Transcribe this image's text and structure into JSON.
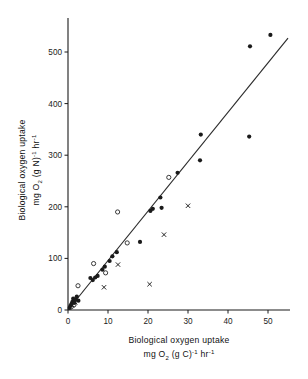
{
  "figure": {
    "background": "#ffffff",
    "ink": "#1a1a1a"
  },
  "chart_data": {
    "type": "scatter",
    "title": "",
    "xlabel": "Biological oxygen uptake mg O2 (g C)-1 hr-1",
    "ylabel": "Biological oxygen uptake mg O2 (g N)-1 hr-1",
    "xlabel_line1": "Biological  oxygen  uptake",
    "xlabel_line2_pre": "mg O",
    "xlabel_line2_sub": "2",
    "xlabel_line2_mid": "  (g C)",
    "xlabel_line2_sup1": "-1",
    "xlabel_line2_post": " hr",
    "xlabel_line2_sup2": "-1",
    "ylabel_line1": "Biological  oxygen  uptake",
    "ylabel_line2_pre": "mg O",
    "ylabel_line2_sub": "2",
    "ylabel_line2_mid": "  (g N)",
    "ylabel_line2_sup1": "-1",
    "ylabel_line2_post": " hr",
    "ylabel_line2_sup2": "-1",
    "xlim": [
      0,
      55
    ],
    "ylim": [
      0,
      545
    ],
    "xticks": [
      0,
      10,
      20,
      30,
      40,
      50
    ],
    "yticks": [
      0,
      100,
      200,
      300,
      400,
      500
    ],
    "xtick_labels": [
      "0",
      "10",
      "20",
      "30",
      "40",
      "50"
    ],
    "ytick_labels": [
      "0",
      "100",
      "200",
      "300",
      "400",
      "500"
    ],
    "grid": false,
    "legend": "none",
    "series": [
      {
        "name": "filled-circle",
        "marker": "filled-circle",
        "color": "#1a1a1a",
        "points": [
          [
            0.4,
            4
          ],
          [
            0.6,
            8
          ],
          [
            0.9,
            12
          ],
          [
            1.1,
            16
          ],
          [
            1.3,
            22
          ],
          [
            1.6,
            14
          ],
          [
            1.9,
            20
          ],
          [
            2.2,
            26
          ],
          [
            2.6,
            18
          ],
          [
            5.6,
            62
          ],
          [
            6.2,
            58
          ],
          [
            6.8,
            63
          ],
          [
            7.4,
            66
          ],
          [
            8.6,
            78
          ],
          [
            9.2,
            84
          ],
          [
            10.4,
            95
          ],
          [
            11.1,
            104
          ],
          [
            12.2,
            112
          ],
          [
            18.0,
            132
          ],
          [
            20.6,
            192
          ],
          [
            21.2,
            196
          ],
          [
            23.1,
            218
          ],
          [
            23.4,
            198
          ],
          [
            27.4,
            266
          ],
          [
            33.0,
            290
          ],
          [
            33.2,
            340
          ],
          [
            45.3,
            336
          ],
          [
            45.5,
            511
          ],
          [
            50.6,
            533
          ]
        ]
      },
      {
        "name": "open-circle",
        "marker": "open-circle",
        "color": "#1a1a1a",
        "points": [
          [
            0.8,
            6
          ],
          [
            1.5,
            10
          ],
          [
            2.5,
            47
          ],
          [
            6.4,
            90
          ],
          [
            9.4,
            72
          ],
          [
            12.4,
            190
          ],
          [
            14.8,
            130
          ],
          [
            25.2,
            257
          ]
        ]
      },
      {
        "name": "cross",
        "marker": "cross",
        "color": "#1a1a1a",
        "points": [
          [
            1.0,
            9
          ],
          [
            1.8,
            15
          ],
          [
            9.0,
            44
          ],
          [
            12.5,
            88
          ],
          [
            20.4,
            50
          ],
          [
            24.0,
            146
          ],
          [
            30.0,
            202
          ]
        ]
      }
    ],
    "fit_line": {
      "name": "regression-line",
      "from": [
        0,
        0
      ],
      "to": [
        55,
        527
      ],
      "slope": 9.58,
      "intercept": 0,
      "color": "#2b2b2b"
    }
  }
}
